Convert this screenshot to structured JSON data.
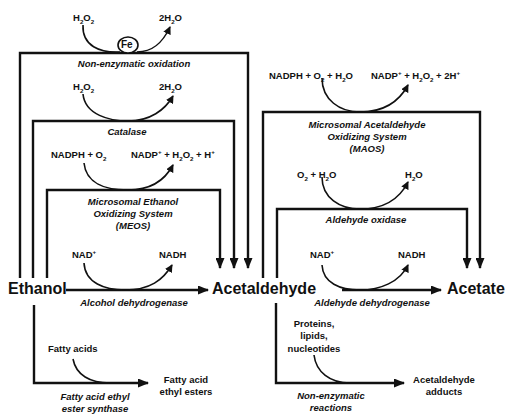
{
  "diagram": {
    "metabolites": {
      "ethanol": "Ethanol",
      "acetaldehyde": "Acetaldehyde",
      "acetate": "Acetate",
      "fatty_acid_ethyl_esters": [
        "Fatty acid",
        "ethyl esters"
      ],
      "acetaldehyde_adducts": [
        "Acetaldehyde",
        "adducts"
      ]
    },
    "ethanol_pathways": [
      {
        "enzyme": "Non-enzymatic oxidation",
        "cofactor": "Fe",
        "substrate": "H2O2",
        "product": "2H2O"
      },
      {
        "enzyme": "Catalase",
        "substrate": "H2O2",
        "product": "2H2O"
      },
      {
        "enzyme": [
          "Microsomal Ethanol",
          "Oxidizing System",
          "(MEOS)"
        ],
        "substrate": "NADPH + O2",
        "product": "NADP+ + H2O2 + H+"
      },
      {
        "enzyme": "Alcohol dehydrogenase",
        "substrate": "NAD+",
        "product": "NADH"
      }
    ],
    "acetaldehyde_pathways": [
      {
        "enzyme": [
          "Microsomal Acetaldehyde",
          "Oxidizing System",
          "(MAOS)"
        ],
        "substrate": "NADPH + O2 + H2O",
        "product": "NADP+ + H2O2 + 2H+"
      },
      {
        "enzyme": "Aldehyde oxidase",
        "substrate": "O2 + H2O",
        "product": "H2O"
      },
      {
        "enzyme": "Aldehyde dehydrogenase",
        "substrate": "NAD+",
        "product": "NADH"
      }
    ],
    "side_branches": [
      {
        "enzyme": [
          "Fatty acid ethyl",
          "ester synthase"
        ],
        "input": "Fatty acids",
        "product": [
          "Fatty acid",
          "ethyl esters"
        ]
      },
      {
        "enzyme": [
          "Non-enzymatic",
          "reactions"
        ],
        "input": [
          "Proteins,",
          "lipids,",
          "nucleotides"
        ],
        "product": [
          "Acetaldehyde",
          "adducts"
        ]
      }
    ],
    "colors": {
      "line": "#111111",
      "background": "#ffffff"
    }
  }
}
